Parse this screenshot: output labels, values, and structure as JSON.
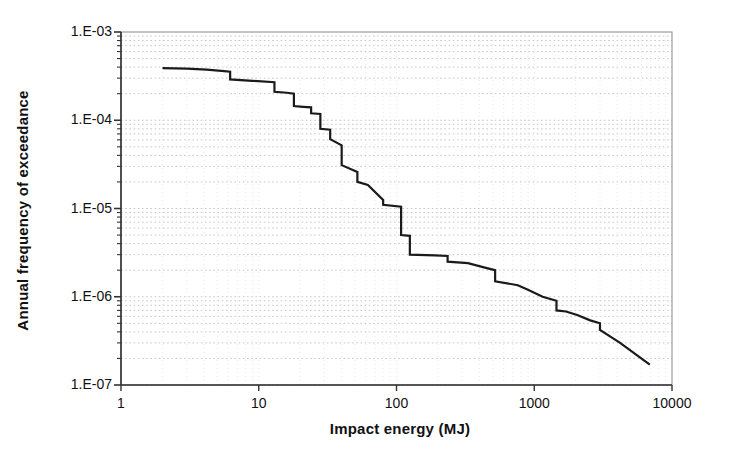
{
  "chart_data": {
    "type": "line",
    "title": "",
    "subtitle": "",
    "xlabel": "Impact energy (MJ)",
    "ylabel": "Annual frequency of exceedance",
    "xscale": "log",
    "yscale": "log",
    "xlim": [
      1,
      10000
    ],
    "ylim": [
      1e-07,
      0.001
    ],
    "xticks": [
      1,
      10,
      100,
      1000,
      10000
    ],
    "xtick_labels": [
      "1",
      "10",
      "100",
      "1000",
      "10000"
    ],
    "yticks": [
      0.001,
      0.0001,
      1e-05,
      1e-06,
      1e-07
    ],
    "ytick_labels": [
      "1.E-03",
      "1.E-04",
      "1.E-05",
      "1.E-06",
      "1.E-07"
    ],
    "grid": true,
    "grid_style": "dotted-minor-horizontal",
    "grid_color": "#b9b9b9",
    "legend": null,
    "legend_position": "none",
    "annotations": [],
    "series": [
      {
        "name": "Exceedance curve",
        "color": "#1a1a1a",
        "line_width": 2.2,
        "marker": "none",
        "x": [
          2.0,
          3.0,
          4.2,
          5.6,
          6.2,
          6.2,
          9.0,
          13.0,
          13.0,
          16.0,
          18.0,
          18.0,
          21.0,
          24.0,
          24.0,
          28.0,
          28.0,
          33.0,
          33.0,
          40.0,
          40.0,
          52.0,
          52.0,
          62.0,
          80.0,
          80.0,
          108.0,
          108.0,
          125.0,
          125.0,
          190.0,
          235.0,
          235.0,
          330.0,
          460.0,
          520.0,
          520.0,
          760.0,
          900.0,
          1150.0,
          1450.0,
          1450.0,
          1700.0,
          2050.0,
          2550.0,
          3000.0,
          3000.0,
          4200.0,
          6900.0
        ],
        "y": [
          0.00039,
          0.000385,
          0.000375,
          0.00036,
          0.000355,
          0.00029,
          0.00028,
          0.00027,
          0.00021,
          0.000205,
          0.0002,
          0.000145,
          0.000142,
          0.00014,
          0.00012,
          0.000118,
          8e-05,
          7.8e-05,
          6.1e-05,
          5.2e-05,
          3.1e-05,
          2.6e-05,
          2e-05,
          1.85e-05,
          1.25e-05,
          1.1e-05,
          1.05e-05,
          5e-06,
          4.9e-06,
          3e-06,
          2.95e-06,
          2.9e-06,
          2.5e-06,
          2.4e-06,
          2.1e-06,
          2e-06,
          1.5e-06,
          1.35e-06,
          1.2e-06,
          1e-06,
          9e-07,
          7e-07,
          6.8e-07,
          6.2e-07,
          5.4e-07,
          5e-07,
          4.2e-07,
          3e-07,
          1.7e-07
        ]
      }
    ]
  },
  "plot_geometry": {
    "left_px": 121,
    "right_px": 672,
    "top_px": 32,
    "bottom_px": 385
  },
  "axes": {
    "x_title": "Impact energy (MJ)",
    "y_title": "Annual frequency of exceedance"
  }
}
